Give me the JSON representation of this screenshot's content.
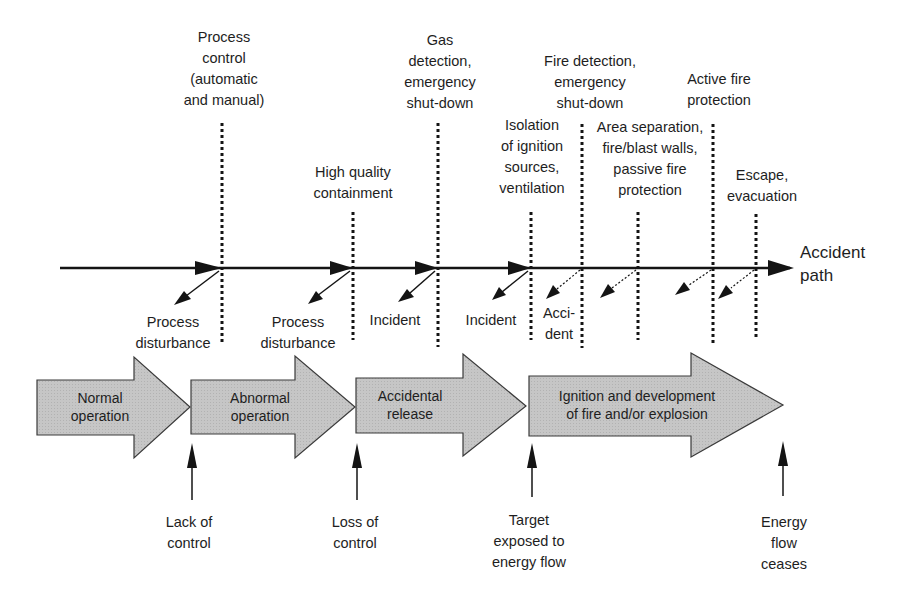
{
  "diagram": {
    "type": "accident-sequence-barrier-diagram",
    "accident_path_label": "Accident\npath",
    "colors": {
      "line": "#141414",
      "stage_fill": "#c8c8c8",
      "stage_stroke": "#3a3a3a",
      "text": "#1e1e1e"
    },
    "barriers": [
      {
        "id": "process-control",
        "label": "Process\ncontrol\n(automatic\nand manual)",
        "x": 222
      },
      {
        "id": "high-quality-containment",
        "label": "High quality\ncontainment",
        "x": 353
      },
      {
        "id": "gas-detection-esd",
        "label": "Gas\ndetection,\nemergency\nshut-down",
        "x": 438
      },
      {
        "id": "isolation-ignition",
        "label": "Isolation\nof ignition\nsources,\nventilation",
        "x": 531
      },
      {
        "id": "fire-detection-esd",
        "label": "Fire detection,\nemergency\nshut-down",
        "x": 582
      },
      {
        "id": "area-separation",
        "label": "Area separation,\nfire/blast walls,\npassive fire\nprotection",
        "x": 638
      },
      {
        "id": "active-fire-protection",
        "label": "Active fire\nprotection",
        "x": 713
      },
      {
        "id": "escape-evacuation",
        "label": "Escape,\nevacuation",
        "x": 756
      }
    ],
    "deviations": [
      {
        "label": "Process\ndisturbance",
        "x": 175
      },
      {
        "label": "Process\ndisturbance",
        "x": 298
      },
      {
        "label": "Incident",
        "x": 395
      },
      {
        "label": "Incident",
        "x": 491
      },
      {
        "label": "Acci-\ndent",
        "x": 562
      }
    ],
    "stages": [
      {
        "label": "Normal\noperation"
      },
      {
        "label": "Abnormal\noperation"
      },
      {
        "label": "Accidental\nrelease"
      },
      {
        "label": "Ignition and development\nof fire and/or explosion"
      }
    ],
    "events": [
      {
        "label": "Lack of\ncontrol",
        "x": 192
      },
      {
        "label": "Loss of\ncontrol",
        "x": 357
      },
      {
        "label": "Target\nexposed to\nenergy flow",
        "x": 529
      },
      {
        "label": "Energy\nflow\nceases",
        "x": 783
      }
    ]
  }
}
